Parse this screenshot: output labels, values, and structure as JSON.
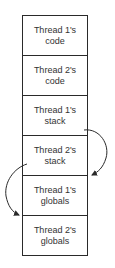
{
  "diagram": {
    "type": "memory-layout",
    "segments": [
      {
        "line1": "Thread 1's",
        "line2": "code"
      },
      {
        "line1": "Thread 2's",
        "line2": "code"
      },
      {
        "line1": "Thread 1's",
        "line2": "stack"
      },
      {
        "line1": "Thread 2's",
        "line2": "stack"
      },
      {
        "line1": "Thread 1's",
        "line2": "globals"
      },
      {
        "line1": "Thread 2's",
        "line2": "globals"
      }
    ],
    "arrows": [
      {
        "from": "Thread 1's stack",
        "to": "Thread 1's globals",
        "side": "right"
      },
      {
        "from": "Thread 2's stack",
        "to": "Thread 2's globals",
        "side": "left"
      }
    ],
    "colors": {
      "line": "#2a2a2a",
      "text": "#333333",
      "background": "#ffffff"
    }
  }
}
